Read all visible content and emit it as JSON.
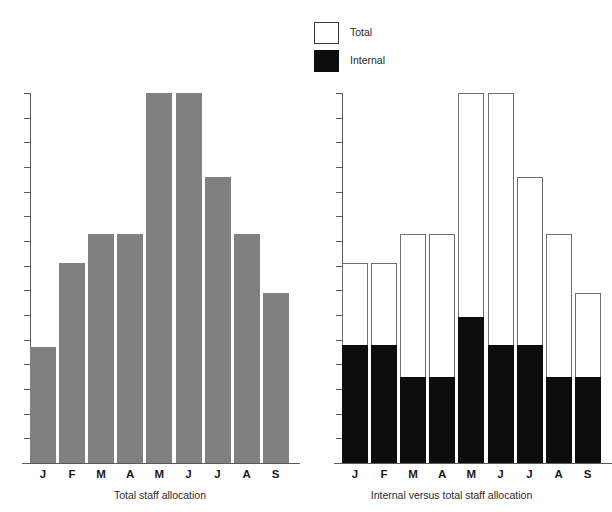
{
  "figure": {
    "background": "#ffffff",
    "width": 593,
    "height": 512
  },
  "legend": {
    "position": "top-center-right",
    "entries": [
      {
        "label": "Total",
        "swatch": "white-outlined-box",
        "color": "#ffffff",
        "border": "#3a3a3a"
      },
      {
        "label": "Internal",
        "swatch": "black-filled-box",
        "color": "#0d0d0d",
        "border": "#0d0d0d"
      }
    ]
  },
  "panels": [
    {
      "id": "left",
      "xlabel": "Total staff allocation",
      "series_color": "#808080"
    },
    {
      "id": "right",
      "xlabel": "Internal versus total staff allocation",
      "total_color": "#ffffff",
      "internal_color": "#0d0d0d"
    }
  ],
  "chart_data": [
    {
      "type": "bar",
      "id": "total-staff-allocation",
      "title": "",
      "xlabel": "Total staff allocation",
      "ylabel": "",
      "categories": [
        "J",
        "F",
        "M",
        "A",
        "M",
        "J",
        "J",
        "A",
        "S"
      ],
      "category_names": [
        "January",
        "February",
        "March",
        "April",
        "May",
        "June",
        "July",
        "August",
        "September"
      ],
      "values": [
        4.7,
        8.1,
        9.3,
        9.3,
        15.0,
        15.0,
        11.6,
        9.3,
        6.9
      ],
      "ylim": [
        0,
        15
      ],
      "ytick_count": 15,
      "ytick_labels": [],
      "grid": false,
      "legend": false,
      "bar_color": "#808080"
    },
    {
      "type": "bar",
      "id": "internal-versus-total-staff-allocation",
      "title": "",
      "xlabel": "Internal versus total staff allocation",
      "ylabel": "",
      "categories": [
        "J",
        "F",
        "M",
        "A",
        "M",
        "J",
        "J",
        "A",
        "S"
      ],
      "category_names": [
        "January",
        "February",
        "March",
        "April",
        "May",
        "June",
        "July",
        "August",
        "September"
      ],
      "series": [
        {
          "name": "Total",
          "values": [
            8.1,
            8.1,
            9.3,
            9.3,
            15.0,
            15.0,
            11.6,
            9.3,
            6.9
          ],
          "color": "#ffffff",
          "style": "outlined"
        },
        {
          "name": "Internal",
          "values": [
            4.8,
            4.8,
            3.5,
            3.5,
            5.9,
            4.8,
            4.8,
            3.5,
            3.5
          ],
          "color": "#0d0d0d",
          "style": "filled"
        }
      ],
      "overlay": "internal-inside-total",
      "ylim": [
        0,
        15
      ],
      "ytick_count": 15,
      "ytick_labels": [],
      "grid": false,
      "legend": true,
      "legend_position": "top"
    }
  ]
}
